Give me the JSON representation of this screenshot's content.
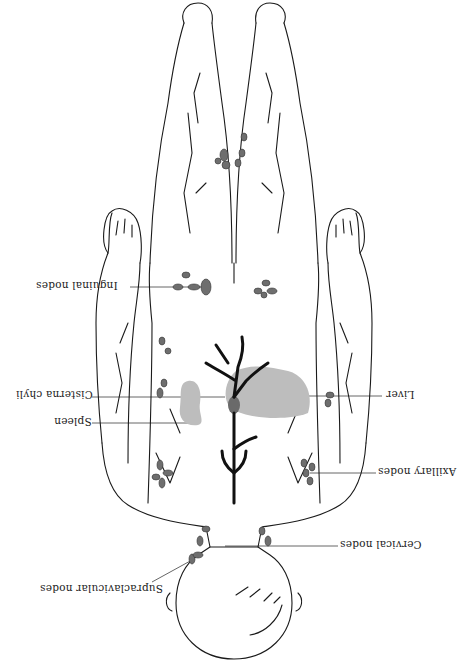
{
  "figure": {
    "orientation": "rotated-180",
    "colors": {
      "outline": "#1a1a1a",
      "node_fill": "#6e6e6e",
      "organ_fill": "#bdbdbd",
      "cisterna_fill": "#6a6a6a",
      "duct": "#111111",
      "leader_line": "#555555",
      "background": "#ffffff"
    }
  },
  "labels": {
    "inguinal": "Inguinal nodes",
    "cisterna": "Cisterna chyli",
    "spleen": "Spleen",
    "supraclavicular": "Supraclavicular nodes",
    "liver": "Liver",
    "axillary": "Axillary nodes",
    "cervical": "Cervical nodes"
  },
  "top_strip_fragments": [
    "'",
    "'",
    "···",
    "···",
    "'",
    "'",
    "·",
    "'",
    "'",
    "'",
    "···",
    "··"
  ]
}
